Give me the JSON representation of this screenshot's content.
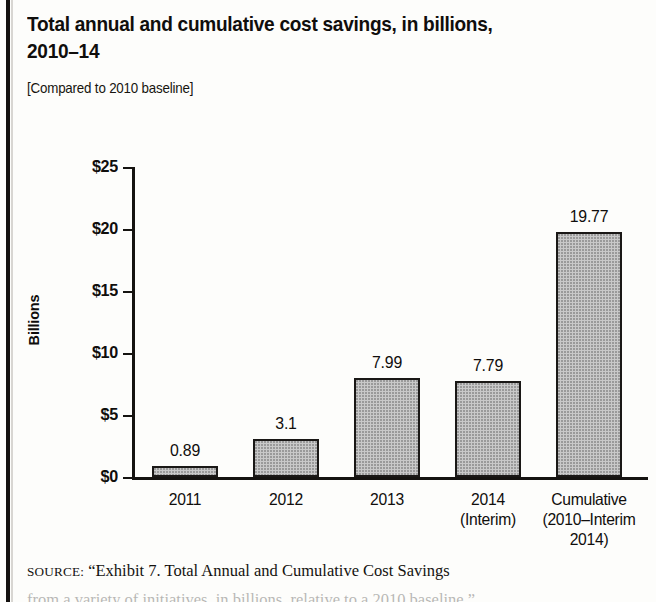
{
  "figure": {
    "title": "Total annual and cumulative cost savings, in billions, 2010–14",
    "subtitle": "[Compared to 2010 baseline]",
    "source_lead": "SOURCE:",
    "source_text": "“Exhibit 7. Total Annual and Cumulative Cost Savings",
    "source_text_cut": "from a variety of initiatives, in billions, relative to a 2010 baseline,”"
  },
  "chart_data": {
    "type": "bar",
    "title": "Total annual and cumulative cost savings, in billions, 2010–14",
    "subtitle": "[Compared to 2010 baseline]",
    "xlabel": "",
    "ylabel": "Billions",
    "categories": [
      "2011",
      "2012",
      "2013",
      "2014\n(Interim)",
      "Cumulative\n(2010–Interim\n2014)"
    ],
    "category_lines": [
      [
        "2011"
      ],
      [
        "2012"
      ],
      [
        "2013"
      ],
      [
        "2014",
        "(Interim)"
      ],
      [
        "Cumulative",
        "(2010–Interim",
        "2014)"
      ]
    ],
    "values": [
      0.89,
      3.1,
      7.99,
      7.79,
      19.77
    ],
    "value_labels": [
      "0.89",
      "3.1",
      "7.99",
      "7.79",
      "19.77"
    ],
    "ylim": [
      0,
      25
    ],
    "yticks": [
      0,
      5,
      10,
      15,
      20,
      25
    ],
    "ytick_labels": [
      "$0",
      "$5",
      "$10",
      "$15",
      "$20",
      "$25"
    ],
    "grid": false,
    "legend": false,
    "bar_fill": "#c9c9c9",
    "bar_edge": "#1a1816"
  }
}
